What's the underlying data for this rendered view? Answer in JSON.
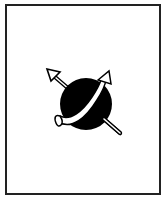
{
  "figure": {
    "colors": {
      "frame": "#222222",
      "sphere": "#000000",
      "arrow_fill": "#ffffff",
      "arrow_stroke": "#000000",
      "background": "#ffffff"
    }
  }
}
